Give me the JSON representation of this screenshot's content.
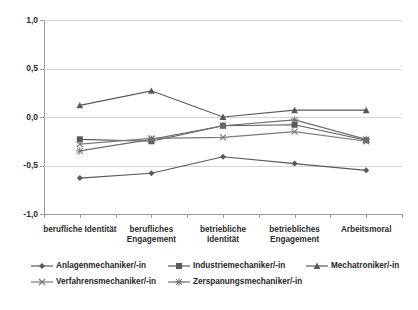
{
  "chart_data": {
    "type": "line",
    "title": "",
    "subtitle": "",
    "xlabel": "",
    "ylabel": "",
    "ylim": [
      -1.0,
      1.0
    ],
    "grid": true,
    "legend_position": "bottom",
    "categories": [
      "berufliche Identität",
      "berufliches\nEngagement",
      "betriebliche\nIdentität",
      "betriebliches\nEngagement",
      "Arbeitsmoral"
    ],
    "ytick_labels": [
      "1,0",
      "0,5",
      "0,0",
      "-0,5",
      "-1,0"
    ],
    "ytick_values": [
      1.0,
      0.5,
      0.0,
      -0.5,
      -1.0
    ],
    "series": [
      {
        "name": "Anlagenmechaniker/-in",
        "marker": "diamond",
        "color": "#595959",
        "values": [
          -0.63,
          -0.58,
          -0.41,
          -0.48,
          -0.55
        ]
      },
      {
        "name": "Industriemechaniker/-in",
        "marker": "square",
        "color": "#595959",
        "values": [
          -0.23,
          -0.25,
          -0.09,
          -0.08,
          -0.24
        ]
      },
      {
        "name": "Mechatroniker/-in",
        "marker": "triangle",
        "color": "#595959",
        "values": [
          0.12,
          0.27,
          0.0,
          0.07,
          0.07
        ]
      },
      {
        "name": "Verfahrensmechaniker/-in",
        "marker": "cross",
        "color": "#7a7a7a",
        "values": [
          -0.28,
          -0.22,
          -0.21,
          -0.15,
          -0.25
        ]
      },
      {
        "name": "Zerspanungsmechaniker/-in",
        "marker": "asterisk",
        "color": "#6e6e6e",
        "values": [
          -0.35,
          -0.23,
          -0.09,
          -0.03,
          -0.23
        ]
      }
    ]
  },
  "axis": {
    "yticks": [
      {
        "label": "1,0",
        "value": 1.0
      },
      {
        "label": "0,5",
        "value": 0.5
      },
      {
        "label": "0,0",
        "value": 0.0
      },
      {
        "label": "-0,5",
        "value": -0.5
      },
      {
        "label": "-1,0",
        "value": -1.0
      }
    ],
    "xticks": [
      {
        "label": "berufliche Identität"
      },
      {
        "label": "berufliches\nEngagement"
      },
      {
        "label": "betriebliche\nIdentität"
      },
      {
        "label": "betriebliches\nEngagement"
      },
      {
        "label": "Arbeitsmoral"
      }
    ]
  },
  "legend": {
    "entries": [
      {
        "label": "Anlagenmechaniker/-in",
        "marker": "diamond"
      },
      {
        "label": "Industriemechaniker/-in",
        "marker": "square"
      },
      {
        "label": "Mechatroniker/-in",
        "marker": "triangle"
      },
      {
        "label": "Verfahrensmechaniker/-in",
        "marker": "cross"
      },
      {
        "label": "Zerspanungsmechaniker/-in",
        "marker": "asterisk"
      }
    ]
  },
  "style": {
    "line_color": "#595959",
    "grid_color": "#d4d4d4",
    "axis_color": "#9a9a9a",
    "background": "#ffffff",
    "text_color": "#1f1f1f"
  }
}
